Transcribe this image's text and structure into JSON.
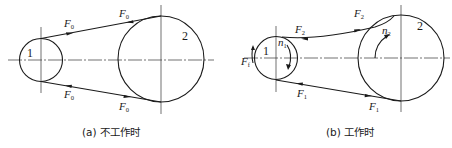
{
  "figure": {
    "type": "belt-drive-tension-diagram",
    "panels": [
      {
        "id": "a",
        "caption": "(a) 不工作时",
        "pulley_small_label": "1",
        "pulley_large_label": "2",
        "tension_labels": {
          "upper_left": {
            "main": "F",
            "sub": "0"
          },
          "upper_right": {
            "main": "F",
            "sub": "0"
          },
          "lower_left": {
            "main": "F",
            "sub": "0"
          },
          "lower_right": {
            "main": "F",
            "sub": "0"
          }
        }
      },
      {
        "id": "b",
        "caption": "(b) 工作时",
        "pulley_small_label": "1",
        "pulley_large_label": "2",
        "speed_labels": {
          "small": {
            "main": "n",
            "sub": "1"
          },
          "large": {
            "main": "n",
            "sub": "2"
          }
        },
        "tension_labels": {
          "upper_left": {
            "main": "F",
            "sub": "2"
          },
          "upper_right": {
            "main": "F",
            "sub": "2"
          },
          "lower_left": {
            "main": "F",
            "sub": "1"
          },
          "lower_right": {
            "main": "F",
            "sub": "1"
          },
          "wrap_left": {
            "main": "F",
            "sub": "f"
          }
        }
      }
    ]
  }
}
